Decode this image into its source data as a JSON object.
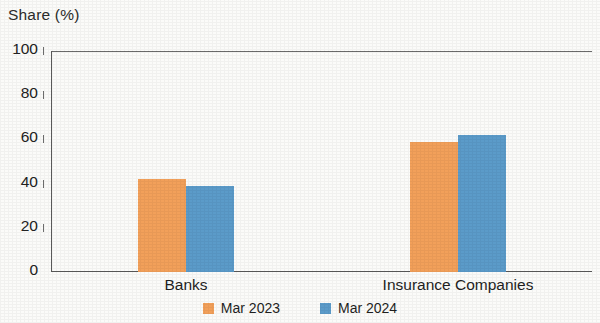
{
  "chart_data": {
    "type": "bar",
    "title": "",
    "ylabel": "Share (%)",
    "xlabel": "",
    "ylim": [
      0,
      100
    ],
    "yticks": [
      0,
      20,
      40,
      60,
      80,
      100
    ],
    "ytick_labels": [
      "0",
      "20",
      "40",
      "60",
      "80",
      "100"
    ],
    "grid": false,
    "legend_position": "bottom-center",
    "categories": [
      "Banks",
      "Insurance Companies"
    ],
    "series": [
      {
        "name": "Mar 2023",
        "color": "#f2a05a",
        "values": [
          42,
          59
        ]
      },
      {
        "name": "Mar 2024",
        "color": "#5b9bc9",
        "values": [
          39,
          62
        ]
      }
    ]
  },
  "axis": {
    "y_title": "Share (%)"
  },
  "legend": {
    "items": [
      {
        "label": "Mar 2023",
        "color": "#f2a05a"
      },
      {
        "label": "Mar 2024",
        "color": "#5b9bc9"
      }
    ]
  }
}
